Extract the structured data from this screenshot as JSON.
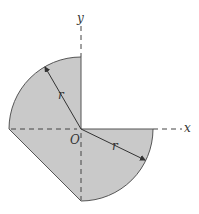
{
  "diagram": {
    "labels": {
      "x_axis": "x",
      "y_axis": "y",
      "origin": "O",
      "radius_upper": "r",
      "radius_lower": "r"
    },
    "colors": {
      "fill": "#c9c9c9",
      "stroke": "#555555",
      "axis": "#444444"
    }
  }
}
